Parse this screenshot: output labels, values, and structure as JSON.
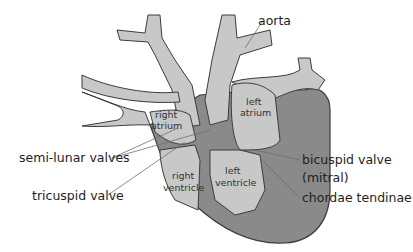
{
  "diagram": {
    "colors": {
      "chamber_fill": "#c8c8c8",
      "muscle_wall": "#8a8a8a",
      "outline": "#3c3c3c",
      "leader_line": "#6e6e6e",
      "background": "#ffffff"
    },
    "labels": {
      "aorta": "aorta",
      "right_atrium_1": "right",
      "right_atrium_2": "atrium",
      "left_atrium_1": "left",
      "left_atrium_2": "atrium",
      "right_ventricle_1": "right",
      "right_ventricle_2": "ventricle",
      "left_ventricle_1": "left",
      "left_ventricle_2": "ventricle",
      "semi_lunar_valves": "semi-lunar valves",
      "tricuspid_valve": "tricuspid valve",
      "bicuspid_valve_1": "bicuspid valve",
      "bicuspid_valve_2": "(mitral)",
      "chordae_tendinae": "chordae tendinae"
    }
  }
}
